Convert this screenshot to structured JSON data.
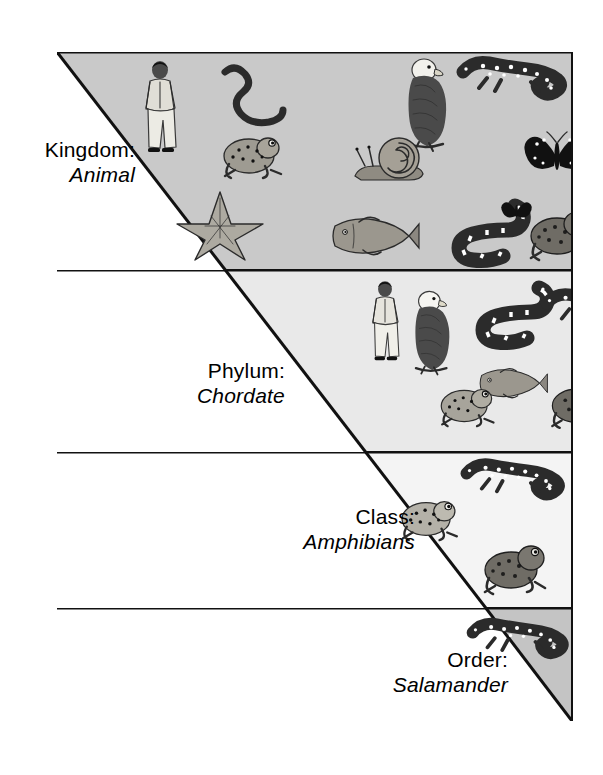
{
  "figure": {
    "type": "taxonomy-classification-triangle",
    "shape": "inverted right triangle, apex at bottom-right, widest at top",
    "background_color": "#ffffff",
    "border_color": "#111111"
  },
  "levels": [
    {
      "id": "kingdom",
      "rank_label": "Kingdom:",
      "taxon_label": "Animal",
      "band_color": "#c9c9c9",
      "organism_count": 12,
      "organisms": [
        "human",
        "earthworm",
        "eagle",
        "spotted-salamander",
        "frog",
        "snail",
        "butterfly",
        "starfish",
        "fish",
        "snake",
        "toad",
        "butterfly"
      ]
    },
    {
      "id": "phylum",
      "rank_label": "Phylum:",
      "taxon_label": "Chordate",
      "band_color": "#e9e9e9",
      "organism_count": 7,
      "organisms": [
        "human",
        "eagle",
        "snake",
        "spotted-salamander",
        "frog",
        "fish",
        "toad"
      ]
    },
    {
      "id": "class",
      "rank_label": "Class:",
      "taxon_label": "Amphibians",
      "band_color": "#f4f4f4",
      "organism_count": 3,
      "organisms": [
        "frog",
        "spotted-salamander",
        "toad"
      ]
    },
    {
      "id": "order",
      "rank_label": "Order:",
      "taxon_label": "Salamander",
      "band_color": "#c4c4c4",
      "organism_count": 1,
      "organisms": [
        "spotted-salamander"
      ]
    }
  ]
}
